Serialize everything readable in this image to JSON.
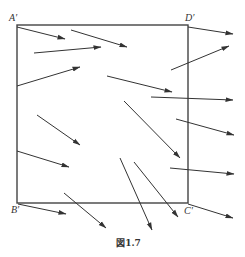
{
  "figure": {
    "caption": "図1.7",
    "colors": {
      "square_stroke": "#444444",
      "arrow_stroke": "#333333",
      "background": "#ffffff"
    },
    "square": {
      "corners": {
        "A_prime": {
          "label": "A′",
          "x": 17,
          "y": 25
        },
        "D_prime": {
          "label": "D′",
          "x": 188,
          "y": 25
        },
        "B_prime": {
          "label": "B′",
          "x": 17,
          "y": 203
        },
        "C_prime": {
          "label": "C′",
          "x": 188,
          "y": 203
        }
      }
    },
    "labels": {
      "A": "A′",
      "D": "D′",
      "B": "B′",
      "C": "C′"
    },
    "arrows": [
      {
        "x1": 17,
        "y1": 27,
        "x2": 65,
        "y2": 39
      },
      {
        "x1": 71,
        "y1": 30,
        "x2": 127,
        "y2": 47
      },
      {
        "x1": 34,
        "y1": 53,
        "x2": 101,
        "y2": 47
      },
      {
        "x1": 17,
        "y1": 86,
        "x2": 80,
        "y2": 67
      },
      {
        "x1": 107,
        "y1": 76,
        "x2": 172,
        "y2": 92
      },
      {
        "x1": 171,
        "y1": 70,
        "x2": 229,
        "y2": 46
      },
      {
        "x1": 188,
        "y1": 27,
        "x2": 233,
        "y2": 34
      },
      {
        "x1": 151,
        "y1": 97,
        "x2": 233,
        "y2": 100
      },
      {
        "x1": 176,
        "y1": 119,
        "x2": 234,
        "y2": 135
      },
      {
        "x1": 37,
        "y1": 115,
        "x2": 80,
        "y2": 145
      },
      {
        "x1": 17,
        "y1": 151,
        "x2": 69,
        "y2": 167
      },
      {
        "x1": 124,
        "y1": 101,
        "x2": 180,
        "y2": 158
      },
      {
        "x1": 170,
        "y1": 168,
        "x2": 234,
        "y2": 174
      },
      {
        "x1": 134,
        "y1": 162,
        "x2": 178,
        "y2": 217
      },
      {
        "x1": 120,
        "y1": 158,
        "x2": 152,
        "y2": 230
      },
      {
        "x1": 64,
        "y1": 193,
        "x2": 106,
        "y2": 228
      },
      {
        "x1": 18,
        "y1": 204,
        "x2": 66,
        "y2": 214
      },
      {
        "x1": 188,
        "y1": 204,
        "x2": 233,
        "y2": 218
      }
    ]
  }
}
